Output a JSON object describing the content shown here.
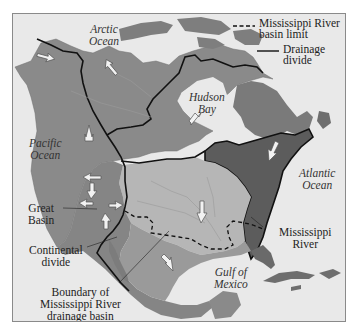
{
  "map": {
    "title": "",
    "subject": "North American drainage basins and the Mississippi River basin",
    "colors": {
      "ocean": "#e9e9e9",
      "land_north": "#8c8c8c",
      "land_west": "#7d7d7d",
      "mississippi_basin": "#b4b4b4",
      "atlantic_slope": "#5e5e5e",
      "divide_line": "#111111",
      "frame": "#8a8a8a"
    }
  },
  "legend": {
    "items": [
      {
        "symbol": "dashed-line",
        "label_line1": "Mississippi River",
        "label_line2": "basin limit"
      },
      {
        "symbol": "solid-line",
        "label_line1": "Drainage",
        "label_line2": "divide"
      }
    ]
  },
  "labels": {
    "arctic_ocean": {
      "line1": "Arctic",
      "line2": "Ocean"
    },
    "hudson_bay": {
      "line1": "Hudson",
      "line2": "Bay"
    },
    "pacific_ocean": {
      "line1": "Pacific",
      "line2": "Ocean"
    },
    "atlantic_ocean": {
      "line1": "Atlantic",
      "line2": "Ocean"
    },
    "gulf_of_mexico": {
      "line1": "Gulf of",
      "line2": "Mexico"
    },
    "great_basin": {
      "line1": "Great",
      "line2": "Basin"
    },
    "continental_divide": {
      "line1": "Continental",
      "line2": "divide"
    },
    "mississippi_river": {
      "line1": "Mississippi",
      "line2": "River"
    },
    "boundary": {
      "line1": "Boundary of",
      "line2": "Mississippi River",
      "line3": "drainage basin"
    }
  }
}
